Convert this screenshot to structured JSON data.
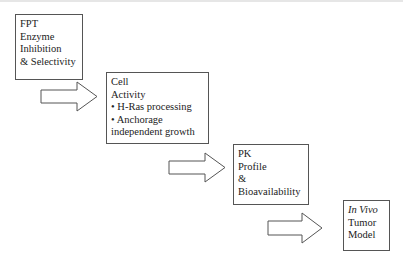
{
  "diagram": {
    "type": "stepwise flow",
    "steps": [
      {
        "id": "fpt",
        "lines": [
          "FPT",
          "Enzyme",
          "Inhibition",
          "& Selectivity"
        ]
      },
      {
        "id": "cell",
        "lines": [
          "Cell",
          "Activity",
          "• H-Ras processing",
          "• Anchorage",
          "independent growth"
        ]
      },
      {
        "id": "pk",
        "lines": [
          "PK",
          "Profile",
          "&",
          "Bioavailability"
        ]
      },
      {
        "id": "invivo",
        "lines": [
          "In Vivo",
          "Tumor",
          "Model"
        ]
      }
    ],
    "arrows": [
      {
        "from": "fpt",
        "to": "cell",
        "shape": "block-arrow-right"
      },
      {
        "from": "cell",
        "to": "pk",
        "shape": "block-arrow-right"
      },
      {
        "from": "pk",
        "to": "invivo",
        "shape": "block-arrow-right"
      }
    ],
    "colors": {
      "stroke": "#555555",
      "fill": "#ffffff",
      "text": "#222222"
    }
  }
}
